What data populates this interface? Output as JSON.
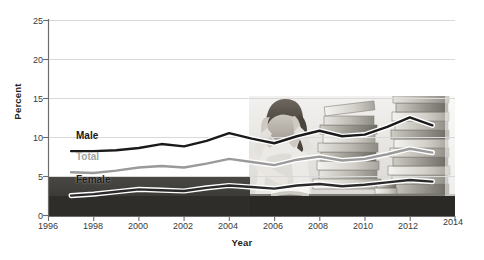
{
  "chart_data": {
    "type": "line",
    "title": "",
    "xlabel": "Year",
    "ylabel": "Percent",
    "xlim": [
      1996,
      2014
    ],
    "ylim": [
      0,
      25
    ],
    "grid": true,
    "legend_position": "inline-labels",
    "x": [
      1997,
      1998,
      1999,
      2000,
      2001,
      2002,
      2003,
      2004,
      2005,
      2006,
      2007,
      2008,
      2009,
      2010,
      2011,
      2012,
      2013
    ],
    "xticks": [
      "1996",
      "1998",
      "2000",
      "2002",
      "2004",
      "2006",
      "2008",
      "2010",
      "2012",
      "2014"
    ],
    "yticks": [
      "0",
      "5",
      "10",
      "15",
      "20",
      "25"
    ],
    "series": [
      {
        "name": "Male",
        "color": "#1a1a1a",
        "label": "Male",
        "values": [
          8.3,
          8.3,
          8.4,
          8.7,
          9.2,
          8.9,
          9.6,
          10.6,
          9.9,
          9.3,
          10.2,
          10.9,
          10.2,
          10.4,
          11.4,
          12.6,
          11.6
        ]
      },
      {
        "name": "Total",
        "color": "#9a9a9a",
        "label": "Total",
        "values": [
          5.6,
          5.5,
          5.8,
          6.2,
          6.4,
          6.2,
          6.7,
          7.3,
          6.9,
          6.5,
          7.2,
          7.6,
          7.1,
          7.3,
          7.9,
          8.6,
          8.1
        ]
      },
      {
        "name": "Female",
        "color": "#2a2a2a",
        "label": "Female",
        "values": [
          2.6,
          2.8,
          3.1,
          3.4,
          3.3,
          3.2,
          3.6,
          3.9,
          3.7,
          3.5,
          3.9,
          4.1,
          3.8,
          4.0,
          4.3,
          4.6,
          4.4
        ]
      }
    ],
    "series_labels": [
      {
        "text": "Male",
        "x_px": 76,
        "y_px": 136
      },
      {
        "text": "Total",
        "x_px": 76,
        "y_px": 157
      },
      {
        "text": "Female",
        "x_px": 76,
        "y_px": 180
      }
    ]
  },
  "photo": {
    "alt_name": "stressed-student-with-books-photo",
    "description": "Photograph of a student holding her head surrounded by tall stacks of books"
  }
}
